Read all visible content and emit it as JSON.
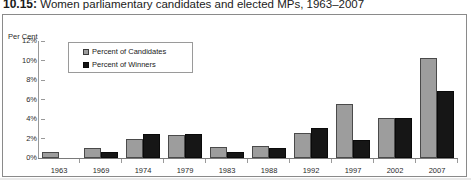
{
  "figure": {
    "number": "10.15:",
    "title": "Women parliamentary candidates and elected MPs, 1963–2007"
  },
  "axis": {
    "y_title": "Per Cent",
    "y_ticks": [
      "12%",
      "10%",
      "8%",
      "6%",
      "4%",
      "2%",
      "0%"
    ]
  },
  "legend": {
    "items": [
      {
        "label": "Percent of Candidates",
        "color": "#9d9d9d"
      },
      {
        "label": "Percent of Winners",
        "color": "#141414"
      }
    ]
  },
  "chart_data": {
    "type": "bar",
    "title": "Women parliamentary candidates and elected MPs, 1963–2007",
    "xlabel": "",
    "ylabel": "Per Cent",
    "ylim": [
      0,
      12
    ],
    "ytick_step": 2,
    "grid": false,
    "legend_position": "top-left-inside",
    "categories": [
      "1963",
      "1969",
      "1974",
      "1979",
      "1983",
      "1988",
      "1992",
      "1997",
      "2002",
      "2007"
    ],
    "series": [
      {
        "name": "Percent of Candidates",
        "color": "#9d9d9d",
        "values": [
          0.6,
          1.0,
          2.0,
          2.35,
          1.15,
          1.25,
          2.55,
          5.5,
          4.1,
          10.3
        ]
      },
      {
        "name": "Percent of Winners",
        "color": "#141414",
        "values": [
          0.0,
          0.6,
          2.5,
          2.45,
          0.6,
          1.0,
          3.1,
          1.8,
          4.15,
          6.85
        ]
      }
    ]
  }
}
